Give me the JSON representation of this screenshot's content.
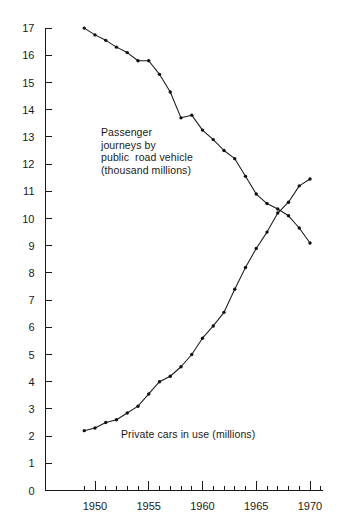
{
  "chart_data": {
    "type": "line",
    "title": "",
    "xlabel": "",
    "ylabel": "",
    "xlim": [
      1948.0,
      1971.2
    ],
    "ylim": [
      0,
      17
    ],
    "grid": false,
    "legend": "inline-annotations",
    "y_ticks": [
      0,
      1,
      2,
      3,
      4,
      5,
      6,
      7,
      8,
      9,
      10,
      11,
      12,
      13,
      14,
      15,
      16,
      17
    ],
    "y_tick_labels": [
      "0",
      "1",
      "2",
      "3",
      "4",
      "5",
      "6",
      "7",
      "8",
      "9",
      "10",
      "11",
      "12",
      "13",
      "14",
      "15",
      "16",
      "17"
    ],
    "x_ticks_major": [
      1950,
      1955,
      1960,
      1965,
      1970
    ],
    "x_tick_labels": [
      "1950",
      "1955",
      "1960",
      "1965",
      "1970"
    ],
    "x_ticks_minor": [
      1949,
      1951,
      1952,
      1953,
      1954,
      1956,
      1957,
      1958,
      1959,
      1961,
      1962,
      1963,
      1964,
      1966,
      1967,
      1968,
      1969,
      1971
    ],
    "x": [
      1949,
      1950,
      1951,
      1952,
      1953,
      1954,
      1955,
      1956,
      1957,
      1958,
      1959,
      1960,
      1961,
      1962,
      1963,
      1964,
      1965,
      1966,
      1967,
      1968,
      1969,
      1970
    ],
    "series": [
      {
        "name": "Passenger journeys by public road vehicle (thousand millions)",
        "short_name": "passenger-journeys",
        "unit": "thousand millions",
        "values": [
          17.0,
          16.75,
          16.55,
          16.3,
          16.1,
          15.8,
          15.8,
          15.3,
          14.65,
          13.7,
          13.8,
          13.25,
          12.9,
          12.5,
          12.2,
          11.55,
          10.9,
          10.55,
          10.35,
          10.1,
          9.65,
          9.1
        ]
      },
      {
        "name": "Private cars in use (millions)",
        "short_name": "private-cars",
        "unit": "millions",
        "values": [
          2.2,
          2.3,
          2.5,
          2.6,
          2.85,
          3.1,
          3.55,
          4.0,
          4.2,
          4.55,
          5.0,
          5.6,
          6.05,
          6.55,
          7.4,
          8.2,
          8.9,
          9.5,
          10.2,
          10.6,
          11.2,
          11.45
        ]
      }
    ],
    "annotations": [
      {
        "id": "passenger-label",
        "lines": [
          "Passenger",
          "journeys by",
          "public  road vehicle",
          "(thousand millions)"
        ],
        "text": "Passenger\njourneys by\npublic  road vehicle\n(thousand millions)"
      },
      {
        "id": "cars-label",
        "lines": [
          "Private cars in use (millions)"
        ],
        "text": "Private cars in use (millions)"
      }
    ],
    "colors": {
      "line": "#1a1a1a",
      "marker": "#111111",
      "axis": "#1a1a1a",
      "background": "#ffffff",
      "text": "#1a1a1a"
    }
  }
}
